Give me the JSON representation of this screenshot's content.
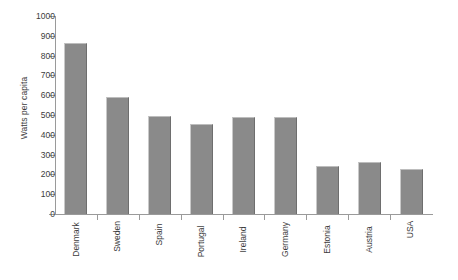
{
  "chart_data": {
    "type": "bar",
    "title": "",
    "subtitle": "",
    "xlabel": "",
    "ylabel": "Watts per capita",
    "categories": [
      "Denmark",
      "Sweden",
      "Spain",
      "Portugal",
      "Ireland",
      "Germany",
      "Estonia",
      "Austria",
      "USA"
    ],
    "values": [
      865,
      590,
      495,
      455,
      488,
      490,
      240,
      265,
      225
    ],
    "ylim": [
      0,
      1000
    ],
    "ytick_labels": [
      "0",
      "100",
      "200",
      "300",
      "400",
      "500",
      "600",
      "700",
      "800",
      "900",
      "1000"
    ],
    "ytick_values": [
      0,
      100,
      200,
      300,
      400,
      500,
      600,
      700,
      800,
      900,
      1000
    ],
    "grid": false,
    "legend": null,
    "legend_position": "none",
    "bar_color": "#8a8a8a",
    "axis_color": "#9a9a9a",
    "text_color": "#3c3c3c",
    "background": "#ffffff"
  }
}
